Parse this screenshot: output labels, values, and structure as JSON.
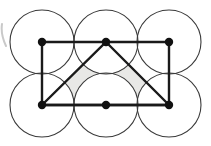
{
  "figure": {
    "title": "Six congruent circles packed in a 3x2 lattice with an inscribed triangle",
    "canvas": {
      "width": 211,
      "height": 146,
      "background": "#ffffff"
    },
    "colors": {
      "circle_stroke": "#3a3a3a",
      "polygon_stroke": "#1a1a1a",
      "vertex_fill": "#111111",
      "shade_fill": "#e8e8e6",
      "background": "#ffffff",
      "scan_artifact": "#c9c9c9"
    },
    "geometry": {
      "circle_radius": 32,
      "circle_stroke_width": 1.1,
      "polygon_stroke_width": 2.4,
      "vertex_radius": 4.2,
      "lattice_columns_x": [
        42,
        106,
        169
      ],
      "lattice_rows_y": [
        42,
        105
      ]
    },
    "circles": [
      {
        "name": "circle-top-left",
        "cx": 42,
        "cy": 42,
        "r": 32
      },
      {
        "name": "circle-top-middle",
        "cx": 106,
        "cy": 42,
        "r": 32
      },
      {
        "name": "circle-top-right",
        "cx": 169,
        "cy": 42,
        "r": 32
      },
      {
        "name": "circle-bottom-left",
        "cx": 42,
        "cy": 105,
        "r": 32
      },
      {
        "name": "circle-bottom-middle",
        "cx": 106,
        "cy": 105,
        "r": 32
      },
      {
        "name": "circle-bottom-right",
        "cx": 169,
        "cy": 105,
        "r": 32
      }
    ],
    "vertices": [
      {
        "name": "vertex-top-left",
        "x": 42,
        "y": 42
      },
      {
        "name": "vertex-top-middle",
        "x": 106,
        "y": 42
      },
      {
        "name": "vertex-top-right",
        "x": 169,
        "y": 42
      },
      {
        "name": "vertex-bottom-left",
        "x": 42,
        "y": 105
      },
      {
        "name": "vertex-bottom-middle",
        "x": 106,
        "y": 105
      },
      {
        "name": "vertex-bottom-right",
        "x": 169,
        "y": 105
      }
    ],
    "rectangle": {
      "name": "bounding-rectangle",
      "points": "42,42 169,42 169,105 42,105",
      "x": 42,
      "y": 42,
      "width": 127,
      "height": 63
    },
    "triangle": {
      "name": "inscribed-triangle",
      "points": "106,42 169,105 42,105",
      "apex": {
        "x": 106,
        "y": 42
      },
      "base_left": {
        "x": 42,
        "y": 105
      },
      "base_right": {
        "x": 169,
        "y": 105
      }
    },
    "shaded_region": {
      "description": "Interior of the inscribed triangle excluding the six circle disks",
      "fill": "#e8e8e6"
    },
    "artifact": {
      "name": "scan-edge-artifact",
      "x": 1,
      "y": 24,
      "width": 5,
      "height": 22
    }
  }
}
